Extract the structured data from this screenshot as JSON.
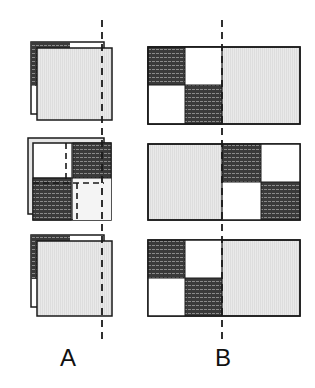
{
  "labels": {
    "a": "A",
    "b": "B"
  },
  "colors": {
    "dark_fill": "#3a3a3a",
    "hatch_line": "#8a8a8a",
    "light_fill": "#e6e6e6",
    "white_fill": "#ffffff",
    "outline": "#1a1a1a",
    "dash": "#1a1a1a"
  },
  "panels": {
    "a": [
      {
        "name": "a-top",
        "layout": "shifted-sheet-dark-edge"
      },
      {
        "name": "a-middle",
        "layout": "quadrants-dark-diagonal"
      },
      {
        "name": "a-bottom",
        "layout": "shifted-sheet-dark-edge"
      }
    ],
    "b": [
      {
        "name": "b-top",
        "layout": "left-checker-right-light"
      },
      {
        "name": "b-middle",
        "layout": "left-light-right-checker"
      },
      {
        "name": "b-bottom",
        "layout": "left-checker-right-light"
      }
    ]
  }
}
